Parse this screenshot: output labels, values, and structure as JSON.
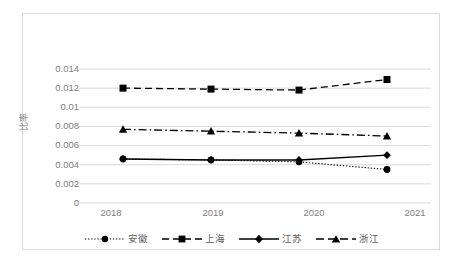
{
  "chart_data": {
    "type": "line",
    "title": "",
    "xlabel": "",
    "ylabel": "比率",
    "categories": [
      "2018",
      "2019",
      "2020",
      "2021"
    ],
    "x": [
      2018,
      2019,
      2020,
      2021
    ],
    "ylim": [
      0,
      0.014
    ],
    "yticks": [
      "0",
      "0.002",
      "0.004",
      "0.006",
      "0.008",
      "0.01",
      "0.012",
      "0.014"
    ],
    "ytick_values": [
      0,
      0.002,
      0.004,
      0.006,
      0.008,
      0.01,
      0.012,
      0.014
    ],
    "grid": "horizontal",
    "legend_position": "bottom",
    "series": [
      {
        "name": "安徽",
        "values": [
          0.0046,
          0.0045,
          0.0043,
          0.0035
        ],
        "marker": "circle",
        "line_style": "dotted",
        "color": "#000000"
      },
      {
        "name": "上海",
        "values": [
          0.012,
          0.0119,
          0.0118,
          0.0129
        ],
        "marker": "square",
        "line_style": "dashed",
        "color": "#000000"
      },
      {
        "name": "江苏",
        "values": [
          0.0046,
          0.0045,
          0.0045,
          0.005
        ],
        "marker": "diamond",
        "line_style": "solid",
        "color": "#000000"
      },
      {
        "name": "浙江",
        "values": [
          0.0077,
          0.0075,
          0.0073,
          0.007
        ],
        "marker": "triangle",
        "line_style": "dashdot",
        "color": "#000000"
      }
    ]
  },
  "axis": {
    "y_title": "比率",
    "y_labels": [
      "0.014",
      "0.012",
      "0.01",
      "0.008",
      "0.006",
      "0.004",
      "0.002",
      "0"
    ],
    "x_labels": [
      "2018",
      "2019",
      "2020",
      "2021"
    ]
  },
  "legend": {
    "items": [
      {
        "label": "安徽"
      },
      {
        "label": "上海"
      },
      {
        "label": "江苏"
      },
      {
        "label": "浙江"
      }
    ]
  },
  "style": {
    "grid_color": "#d9d9d9",
    "text_color": "#808080",
    "series_color": "#000000",
    "frame_color": "#d9d9d9",
    "background": "#ffffff"
  }
}
